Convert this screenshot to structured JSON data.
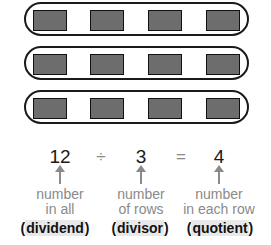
{
  "diagram": {
    "rows": 3,
    "tiles_per_row": 4,
    "colors": {
      "tile": "#6d6d6d",
      "outline": "#1a1a1a",
      "label": "#8a8a8a"
    }
  },
  "equation": {
    "dividend": "12",
    "divide_sign": "÷",
    "divisor": "3",
    "equals_sign": "=",
    "quotient": "4"
  },
  "labels": {
    "dividend": {
      "line1": "number",
      "line2": "in all",
      "term_open": "(",
      "term": "dividend",
      "term_close": ")"
    },
    "divisor": {
      "line1": "number",
      "line2": "of rows",
      "term_open": "(",
      "term": "divisor",
      "term_close": ")"
    },
    "quotient": {
      "line1": "number",
      "line2": "in each row",
      "term_open": "(",
      "term": "quotient",
      "term_close": ")"
    }
  }
}
